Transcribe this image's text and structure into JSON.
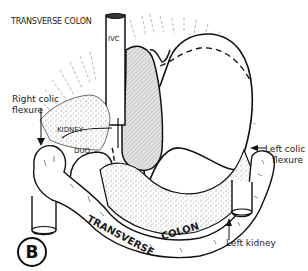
{
  "figure": {
    "panel_letter": "B",
    "labels": {
      "title": "TRANSVERSE COLON",
      "ivc": "IVC",
      "right_colic_flexure_line1": "Right colic",
      "right_colic_flexure_line2": "flexure",
      "kidney": "KIDNEY",
      "duo": "DUO",
      "left_colic_flexure_line1": "Left colic",
      "left_colic_flexure_line2": "flexure",
      "left_kidney": "Left kidney",
      "colon_text_1": "TRANSVERSE",
      "colon_text_2": "COLON"
    },
    "structures": [
      "stomach",
      "inferior vena cava",
      "pancreas",
      "right kidney",
      "duodenum",
      "transverse colon",
      "left kidney"
    ],
    "colors": {
      "line": "#111111",
      "stipple": "#9a9a9a",
      "hatch_fill": "#d9d9d9",
      "background": "#ffffff"
    }
  }
}
